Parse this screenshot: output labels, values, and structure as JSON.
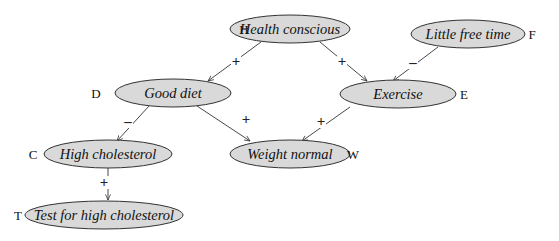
{
  "diagram": {
    "type": "causal-network",
    "nodes": [
      {
        "id": "H",
        "letter": "H",
        "label": "Health conscious",
        "cx": 290,
        "cy": 29,
        "rx": 60,
        "ry": 14,
        "letter_x": 244,
        "letter_y": 34
      },
      {
        "id": "F",
        "letter": "F",
        "label": "Little free time",
        "cx": 468,
        "cy": 34,
        "rx": 57,
        "ry": 14,
        "letter_x": 532,
        "letter_y": 39
      },
      {
        "id": "D",
        "letter": "D",
        "label": "Good diet",
        "cx": 173,
        "cy": 93,
        "rx": 58,
        "ry": 14,
        "letter_x": 96,
        "letter_y": 98
      },
      {
        "id": "E",
        "letter": "E",
        "label": "Exercise",
        "cx": 398,
        "cy": 94,
        "rx": 58,
        "ry": 14,
        "letter_x": 464,
        "letter_y": 99
      },
      {
        "id": "C",
        "letter": "C",
        "label": "High cholesterol",
        "cx": 108,
        "cy": 154,
        "rx": 64,
        "ry": 14,
        "letter_x": 33,
        "letter_y": 159
      },
      {
        "id": "W",
        "letter": "W",
        "label": "Weight normal",
        "cx": 290,
        "cy": 154,
        "rx": 60,
        "ry": 14,
        "letter_x": 353,
        "letter_y": 159
      },
      {
        "id": "T",
        "letter": "T",
        "label": "Test for high cholesterol",
        "cx": 104,
        "cy": 215,
        "rx": 79,
        "ry": 14,
        "letter_x": 18,
        "letter_y": 220
      }
    ],
    "edges": [
      {
        "from": "H",
        "to": "D",
        "sign": "+",
        "x1": 261,
        "y1": 42,
        "x2": 208,
        "y2": 81,
        "sx": 236,
        "sy": 66
      },
      {
        "from": "H",
        "to": "E",
        "sign": "+",
        "x1": 320,
        "y1": 42,
        "x2": 367,
        "y2": 81,
        "sx": 342,
        "sy": 66
      },
      {
        "from": "F",
        "to": "E",
        "sign": "–",
        "x1": 438,
        "y1": 47,
        "x2": 393,
        "y2": 81,
        "sx": 413,
        "sy": 67
      },
      {
        "from": "D",
        "to": "C",
        "sign": "–",
        "x1": 149,
        "y1": 106,
        "x2": 117,
        "y2": 141,
        "sx": 128,
        "sy": 126
      },
      {
        "from": "D",
        "to": "W",
        "sign": "+",
        "x1": 197,
        "y1": 106,
        "x2": 250,
        "y2": 141,
        "sx": 246,
        "sy": 124
      },
      {
        "from": "E",
        "to": "W",
        "sign": "+",
        "x1": 350,
        "y1": 107,
        "x2": 302,
        "y2": 141,
        "sx": 321,
        "sy": 126
      },
      {
        "from": "C",
        "to": "T",
        "sign": "+",
        "x1": 108,
        "y1": 168,
        "x2": 108,
        "y2": 200,
        "sx": 104,
        "sy": 187
      }
    ]
  }
}
